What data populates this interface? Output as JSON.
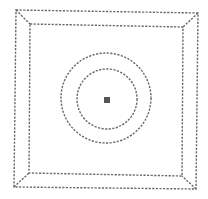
{
  "diagram": {
    "colors": {
      "background": "#ffffff",
      "line": "#6a6a6a",
      "center_marker": "#555555"
    },
    "outer_frame": {
      "corners": [
        [
          16,
          10
        ],
        [
          198,
          13
        ],
        [
          196,
          189
        ],
        [
          14,
          187
        ]
      ]
    },
    "inner_frame": {
      "corners": [
        [
          30,
          24
        ],
        [
          183,
          27
        ],
        [
          182,
          176
        ],
        [
          29,
          173
        ]
      ]
    },
    "outer_circle": {
      "cx": 106,
      "cy": 98,
      "r": 45
    },
    "inner_circle": {
      "cx": 107,
      "cy": 99,
      "r": 30
    },
    "center_marker": {
      "x": 104,
      "y": 97,
      "size": 6
    }
  }
}
